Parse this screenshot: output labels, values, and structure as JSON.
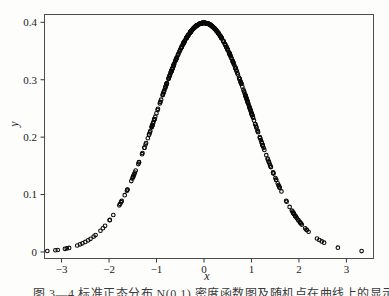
{
  "figure": {
    "caption": "图 3—4 标准正态分布 N(0,1) 密度函数图及随机点在曲线上的显示"
  },
  "chart_data": {
    "type": "scatter",
    "title": "",
    "xlabel": "x",
    "ylabel": "y",
    "xlim": [
      -3.37,
      3.56
    ],
    "ylim": [
      -0.0105,
      0.4145
    ],
    "xticks": [
      -3,
      -2,
      -1,
      0,
      1,
      2,
      3
    ],
    "xtick_labels": [
      "−3",
      "−2",
      "−1",
      "0",
      "1",
      "2",
      "3"
    ],
    "yticks": [
      0,
      0.1,
      0.2,
      0.3,
      0.4
    ],
    "ytick_labels": [
      "0",
      "0.1",
      "0.2",
      "0.3",
      "0.4"
    ],
    "grid": false,
    "legend": "none",
    "marker": "open-circle",
    "marker_color": "#0a0a0a",
    "frame_color": "#4d4d4d",
    "curve": "y = exp(-x^2/2)/sqrt(2*pi) (standard normal pdf)",
    "peak": {
      "x": 0,
      "y": 0.3989
    },
    "sample": {
      "distribution": "N(0,1)",
      "n_body": 430,
      "body_range": [
        -2.35,
        2.35
      ],
      "seed": 12345
    },
    "tail_points_x": [
      -3.3,
      -3.13,
      -3.08,
      -2.93,
      -2.89,
      -2.84,
      -2.67,
      -2.61,
      -2.56,
      -2.5,
      -2.44,
      -2.39,
      2.38,
      2.43,
      2.48,
      2.53,
      2.82,
      3.32
    ]
  }
}
